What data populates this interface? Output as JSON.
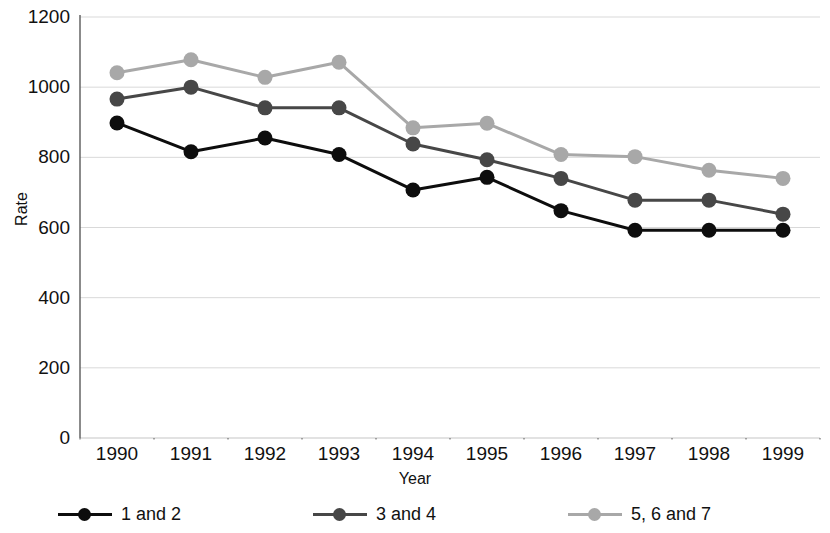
{
  "chart_data": {
    "type": "line",
    "title": "",
    "xlabel": "Year",
    "ylabel": "Rate",
    "categories": [
      "1990",
      "1991",
      "1992",
      "1993",
      "1994",
      "1995",
      "1996",
      "1997",
      "1998",
      "1999"
    ],
    "x": [
      1990,
      1991,
      1992,
      1993,
      1994,
      1995,
      1996,
      1997,
      1998,
      1999
    ],
    "ylim": [
      0,
      1200
    ],
    "yticks": [
      0,
      200,
      400,
      600,
      800,
      1000,
      1200
    ],
    "ytick_labels": [
      "0",
      "200",
      "400",
      "600",
      "800",
      "1000",
      "1200"
    ],
    "grid": true,
    "grid_axis": "y",
    "legend_position": "bottom",
    "series": [
      {
        "name": "1 and 2",
        "color": "#0d0d0d",
        "values": [
          898,
          816,
          855,
          808,
          707,
          743,
          648,
          592,
          592,
          592
        ]
      },
      {
        "name": "3 and 4",
        "color": "#474747",
        "values": [
          966,
          1000,
          941,
          941,
          838,
          793,
          740,
          678,
          678,
          638
        ]
      },
      {
        "name": "5, 6 and 7",
        "color": "#a8a8a8",
        "values": [
          1041,
          1078,
          1028,
          1071,
          884,
          897,
          808,
          802,
          763,
          740
        ]
      }
    ]
  },
  "axes": {
    "y_title": "Rate",
    "x_title": "Year"
  },
  "legend": {
    "items": [
      {
        "label": "1 and 2",
        "color": "#0d0d0d",
        "marker": "circle-marker"
      },
      {
        "label": "3 and 4",
        "color": "#474747",
        "marker": "circle-marker"
      },
      {
        "label": "5, 6 and 7",
        "color": "#a8a8a8",
        "marker": "circle-marker"
      }
    ]
  },
  "colors": {
    "grid": "#d9d9d9",
    "axis": "#5a5a5a",
    "text": "#111111",
    "background": "#ffffff"
  }
}
